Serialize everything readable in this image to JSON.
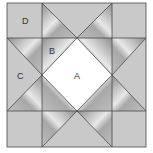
{
  "diagram": {
    "type": "quilt-block",
    "labels": {
      "A": "A",
      "B": "B",
      "C": "C",
      "D": "D"
    },
    "colors": {
      "background": "#ffffff",
      "light": "#c9c9c9",
      "dark_start": "#8c8c8c",
      "dark_mid": "#e6e6e6",
      "dark_end": "#9a9a9a",
      "center": "#ffffff",
      "line": "#4a4a4a"
    }
  }
}
